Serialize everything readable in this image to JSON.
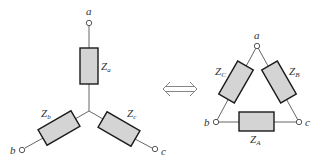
{
  "wye": {
    "terminals": [
      "a",
      "b",
      "c"
    ],
    "impedances": [
      {
        "base": "Z",
        "sub": "a"
      },
      {
        "base": "Z",
        "sub": "b"
      },
      {
        "base": "Z",
        "sub": "c"
      }
    ]
  },
  "equivalence_symbol": "⇔",
  "delta": {
    "terminals": [
      "a",
      "b",
      "c"
    ],
    "impedances": [
      {
        "base": "Z",
        "sub": "A"
      },
      {
        "base": "Z",
        "sub": "B"
      },
      {
        "base": "Z",
        "sub": "C"
      }
    ]
  }
}
